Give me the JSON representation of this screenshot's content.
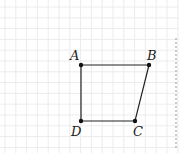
{
  "diagram": {
    "type": "quadrilateral-on-grid",
    "grid": {
      "spacing": 10.8,
      "color": "#ececec"
    },
    "points": {
      "A": {
        "label": "A",
        "x": 81,
        "y": 65
      },
      "B": {
        "label": "B",
        "x": 149,
        "y": 65
      },
      "C": {
        "label": "C",
        "x": 135,
        "y": 121
      },
      "D": {
        "label": "D",
        "x": 81,
        "y": 121
      }
    },
    "edges": [
      [
        "A",
        "B"
      ],
      [
        "B",
        "C"
      ],
      [
        "C",
        "D"
      ],
      [
        "D",
        "A"
      ]
    ],
    "dashed_line": {
      "x": 176,
      "y1": 38,
      "y2": 150
    },
    "colors": {
      "stroke": "#222222",
      "dashed": "#999999"
    }
  }
}
